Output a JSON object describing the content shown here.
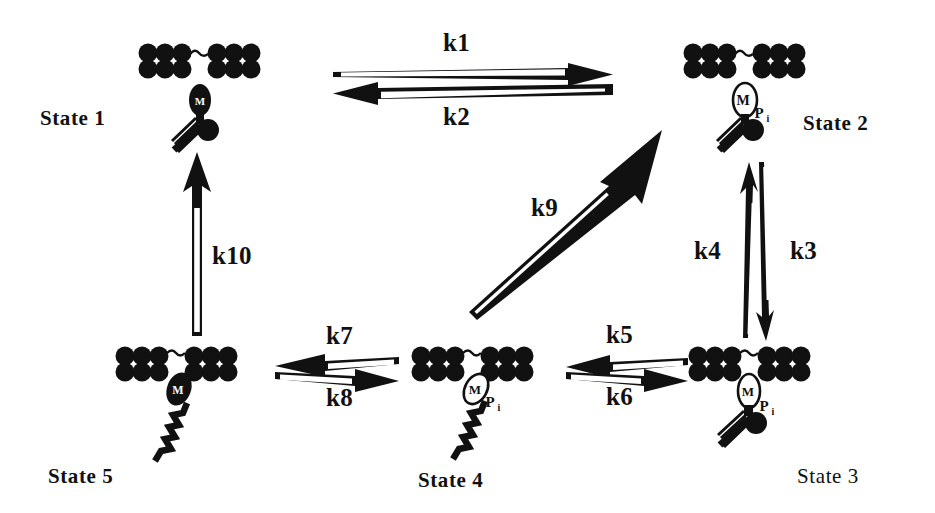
{
  "diagram": {
    "background_color": "#ffffff",
    "ink_color": "#111111"
  },
  "states": [
    {
      "id": "state1",
      "label": "State 1",
      "label_weight": "bold",
      "head_fill": "solid",
      "head_letter": "M",
      "phosphate_label": "",
      "tail_style": "short-zigzag",
      "attached": false,
      "label_x": 40,
      "label_y": 108,
      "mol_x": 140,
      "mol_y": 44
    },
    {
      "id": "state2",
      "label": "State 2",
      "label_weight": "bold",
      "head_fill": "hollow",
      "head_letter": "M",
      "phosphate_label": "P",
      "phosphate_sub": "i",
      "tail_style": "short-zigzag",
      "attached": false,
      "label_x": 803,
      "label_y": 113,
      "mol_x": 685,
      "mol_y": 44
    },
    {
      "id": "state3",
      "label": "State 3",
      "label_weight": "normal",
      "head_fill": "hollow",
      "head_letter": "M",
      "phosphate_label": "P",
      "phosphate_sub": "i",
      "tail_style": "short-zigzag",
      "attached": true,
      "label_x": 797,
      "label_y": 466,
      "mol_x": 690,
      "mol_y": 347
    },
    {
      "id": "state4",
      "label": "State 4",
      "label_weight": "bold",
      "head_fill": "hollow",
      "head_letter": "M",
      "phosphate_label": "P",
      "phosphate_sub": "i",
      "tail_style": "long-zigzag",
      "attached": true,
      "label_x": 418,
      "label_y": 470,
      "mol_x": 413,
      "mol_y": 347
    },
    {
      "id": "state5",
      "label": "State 5",
      "label_weight": "bold",
      "head_fill": "solid",
      "head_letter": "M",
      "phosphate_label": "",
      "tail_style": "long-zigzag",
      "attached": true,
      "label_x": 48,
      "label_y": 466,
      "mol_x": 117,
      "mol_y": 347
    }
  ],
  "rate_constants": [
    {
      "id": "k1",
      "label": "k1",
      "x": 443,
      "y": 30,
      "direction": "right",
      "pair": "k1-k2"
    },
    {
      "id": "k2",
      "label": "k2",
      "x": 443,
      "y": 104,
      "direction": "left",
      "pair": "k1-k2"
    },
    {
      "id": "k3",
      "label": "k3",
      "x": 790,
      "y": 238,
      "direction": "down",
      "pair": "k3-k4"
    },
    {
      "id": "k4",
      "label": "k4",
      "x": 694,
      "y": 238,
      "direction": "up",
      "pair": "k3-k4"
    },
    {
      "id": "k5",
      "label": "k5",
      "x": 606,
      "y": 322,
      "direction": "left",
      "pair": "k5-k6"
    },
    {
      "id": "k6",
      "label": "k6",
      "x": 606,
      "y": 384,
      "direction": "right",
      "pair": "k5-k6"
    },
    {
      "id": "k7",
      "label": "k7",
      "x": 326,
      "y": 323,
      "direction": "left",
      "pair": "k7-k8"
    },
    {
      "id": "k8",
      "label": "k8",
      "x": 326,
      "y": 385,
      "direction": "right",
      "pair": "k7-k8"
    },
    {
      "id": "k9",
      "label": "k9",
      "x": 531,
      "y": 195,
      "direction": "diagonal-up-right",
      "pair": "k9"
    },
    {
      "id": "k10",
      "label": "k10",
      "x": 212,
      "y": 243,
      "direction": "up",
      "pair": "k10"
    }
  ],
  "actin_filament": {
    "bead_count_per_row": 6,
    "rows": 2,
    "bead_color": "#111111",
    "gap_connector": "tilde-arc"
  }
}
